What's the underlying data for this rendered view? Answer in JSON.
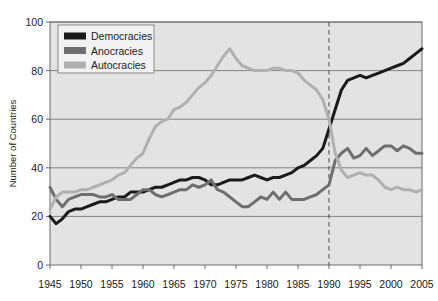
{
  "chart_data": {
    "type": "line",
    "title": "",
    "xlabel": "",
    "ylabel": "Number of Countries",
    "xlim": [
      1945,
      2005
    ],
    "ylim": [
      0,
      100
    ],
    "xticks": [
      1945,
      1950,
      1955,
      1960,
      1965,
      1970,
      1975,
      1980,
      1985,
      1990,
      1995,
      2000,
      2005
    ],
    "yticks": [
      0,
      20,
      40,
      60,
      80,
      100
    ],
    "grid": "horizontal",
    "legend_position": "top-left",
    "plot_background": "#e3e3e3",
    "annotations": [
      {
        "type": "vertical-dashed-line",
        "x": 1990,
        "color": "#555555"
      }
    ],
    "x": [
      1945,
      1946,
      1947,
      1948,
      1949,
      1950,
      1951,
      1952,
      1953,
      1954,
      1955,
      1956,
      1957,
      1958,
      1959,
      1960,
      1961,
      1962,
      1963,
      1964,
      1965,
      1966,
      1967,
      1968,
      1969,
      1970,
      1971,
      1972,
      1973,
      1974,
      1975,
      1976,
      1977,
      1978,
      1979,
      1980,
      1981,
      1982,
      1983,
      1984,
      1985,
      1986,
      1987,
      1988,
      1989,
      1990,
      1991,
      1992,
      1993,
      1994,
      1995,
      1996,
      1997,
      1998,
      1999,
      2000,
      2001,
      2002,
      2003,
      2004,
      2005
    ],
    "series": [
      {
        "name": "Democracies",
        "color": "#1a1a1a",
        "values": [
          20,
          17,
          19,
          22,
          23,
          23,
          24,
          25,
          26,
          26,
          27,
          28,
          28,
          30,
          30,
          30,
          31,
          32,
          32,
          33,
          34,
          35,
          35,
          36,
          36,
          35,
          33,
          33,
          34,
          35,
          35,
          35,
          36,
          37,
          36,
          35,
          36,
          36,
          37,
          38,
          40,
          41,
          43,
          45,
          48,
          56,
          64,
          72,
          76,
          77,
          78,
          77,
          78,
          79,
          80,
          81,
          82,
          83,
          85,
          87,
          89
        ]
      },
      {
        "name": "Anocracies",
        "color": "#6e6e6e",
        "values": [
          32,
          27,
          24,
          27,
          28,
          29,
          29,
          29,
          28,
          28,
          29,
          27,
          27,
          27,
          29,
          31,
          31,
          29,
          28,
          29,
          30,
          31,
          31,
          33,
          32,
          33,
          35,
          31,
          30,
          28,
          26,
          24,
          24,
          26,
          28,
          27,
          30,
          27,
          30,
          27,
          27,
          27,
          28,
          29,
          31,
          33,
          43,
          46,
          48,
          44,
          45,
          48,
          45,
          47,
          49,
          49,
          47,
          49,
          48,
          46,
          46
        ]
      },
      {
        "name": "Autocracies",
        "color": "#b0b0b0",
        "values": [
          23,
          28,
          30,
          30,
          30,
          31,
          31,
          32,
          33,
          34,
          35,
          37,
          38,
          41,
          44,
          46,
          52,
          57,
          59,
          60,
          64,
          65,
          67,
          70,
          73,
          75,
          78,
          82,
          86,
          89,
          85,
          82,
          81,
          80,
          80,
          80,
          81,
          81,
          80,
          80,
          79,
          76,
          74,
          72,
          68,
          60,
          46,
          39,
          36,
          37,
          38,
          37,
          37,
          35,
          32,
          31,
          32,
          31,
          31,
          30,
          31
        ]
      }
    ]
  },
  "legend": {
    "items": [
      {
        "label": "Democracies",
        "color": "#1a1a1a"
      },
      {
        "label": "Anocracies",
        "color": "#6e6e6e"
      },
      {
        "label": "Autocracies",
        "color": "#b0b0b0"
      }
    ]
  }
}
